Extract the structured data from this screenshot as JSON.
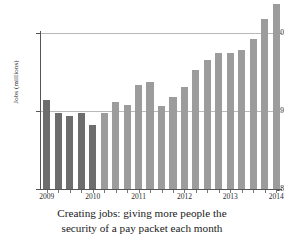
{
  "chart_data": {
    "type": "bar",
    "title": "",
    "caption_line1": "Creating jobs: giving more people the",
    "caption_line2": "security of a pay packet each month",
    "xlabel": "",
    "ylabel": "Jobs (millions)",
    "ylim": [
      28,
      30.5
    ],
    "yticks": [
      28,
      29,
      30
    ],
    "ytick_labels": [
      "28",
      "29",
      "30"
    ],
    "grid": true,
    "gridlines_at": [
      29,
      30
    ],
    "legend": "none",
    "xtick_labels": [
      "2009",
      "2010",
      "2011",
      "2012",
      "2013",
      "2014"
    ],
    "xtick_at_index": [
      0,
      4,
      8,
      12,
      16,
      20
    ],
    "categories": [
      "2009 Q1",
      "2009 Q2",
      "2009 Q3",
      "2009 Q4",
      "2010 Q1",
      "2010 Q2",
      "2010 Q3",
      "2010 Q4",
      "2011 Q1",
      "2011 Q2",
      "2011 Q3",
      "2011 Q4",
      "2012 Q1",
      "2012 Q2",
      "2012 Q3",
      "2012 Q4",
      "2013 Q1",
      "2013 Q2",
      "2013 Q3",
      "2013 Q4",
      "2014 Q1"
    ],
    "values": [
      29.14,
      28.98,
      28.94,
      28.97,
      28.82,
      28.97,
      29.12,
      29.08,
      29.33,
      29.37,
      29.07,
      29.18,
      29.31,
      29.52,
      29.66,
      29.75,
      29.75,
      29.78,
      29.92,
      30.18,
      30.37
    ],
    "series_colors": {
      "dark": "#6d6d6d",
      "light": "#9c9c9c"
    },
    "dark_until_index": 4,
    "axis_color": "#555555",
    "grid_color": "#b9b9b9"
  }
}
